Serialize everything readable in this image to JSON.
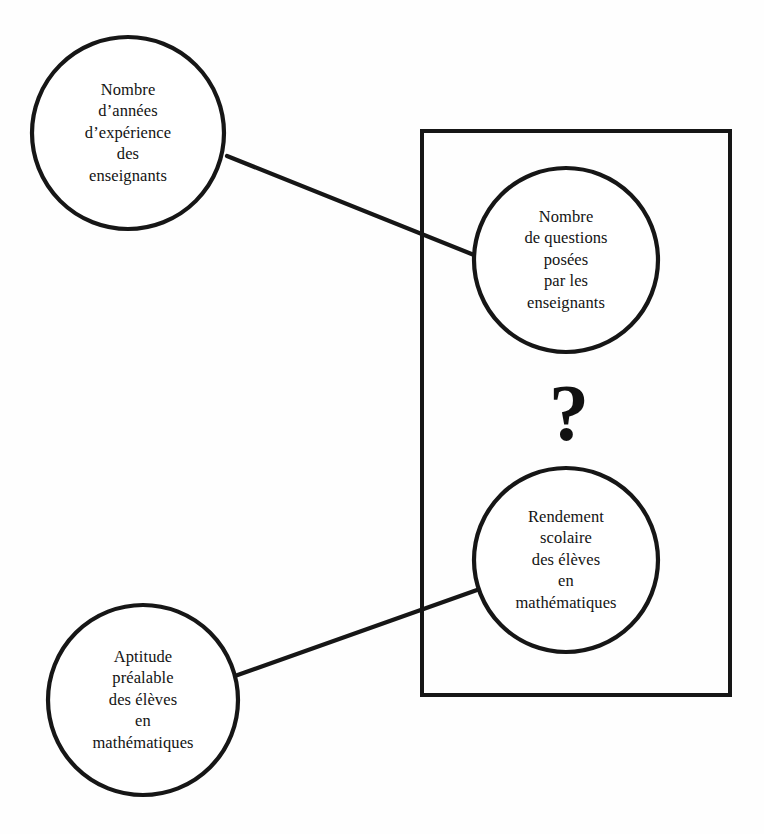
{
  "diagram": {
    "type": "conceptual-path-diagram",
    "language": "fr",
    "background_color": "#fefefe",
    "stroke_color": "#161616",
    "nodes": [
      {
        "id": "experience",
        "label": "Nombre\nd’années\nd’expérience\ndes\nenseignants",
        "shape": "circle",
        "cx": 128,
        "cy": 133,
        "r": 96,
        "inside_box": false
      },
      {
        "id": "questions",
        "label": "Nombre\nde questions\nposées\npar les\nenseignants",
        "shape": "circle",
        "cx": 566,
        "cy": 260,
        "r": 92,
        "inside_box": true
      },
      {
        "id": "rendement",
        "label": "Rendement\nscolaire\ndes élèves\nen\nmathématiques",
        "shape": "circle",
        "cx": 566,
        "cy": 560,
        "r": 92,
        "inside_box": true
      },
      {
        "id": "aptitude",
        "label": "Aptitude\npréalable\ndes élèves\nen\nmathématiques",
        "shape": "circle",
        "cx": 143,
        "cy": 700,
        "r": 95,
        "inside_box": false
      }
    ],
    "box": {
      "id": "focus-box",
      "x": 422,
      "y": 131,
      "width": 308,
      "height": 564
    },
    "edges": [
      {
        "id": "experience-to-questions",
        "from": "experience",
        "to": "questions",
        "x1": 227,
        "y1": 156,
        "x2": 474,
        "y2": 255
      },
      {
        "id": "aptitude-to-rendement",
        "from": "aptitude",
        "to": "rendement",
        "x1": 232,
        "y1": 677,
        "x2": 477,
        "y2": 590
      }
    ],
    "annotations": [
      {
        "id": "question-mark",
        "symbol": "?",
        "cx": 569,
        "cy": 413
      }
    ]
  }
}
